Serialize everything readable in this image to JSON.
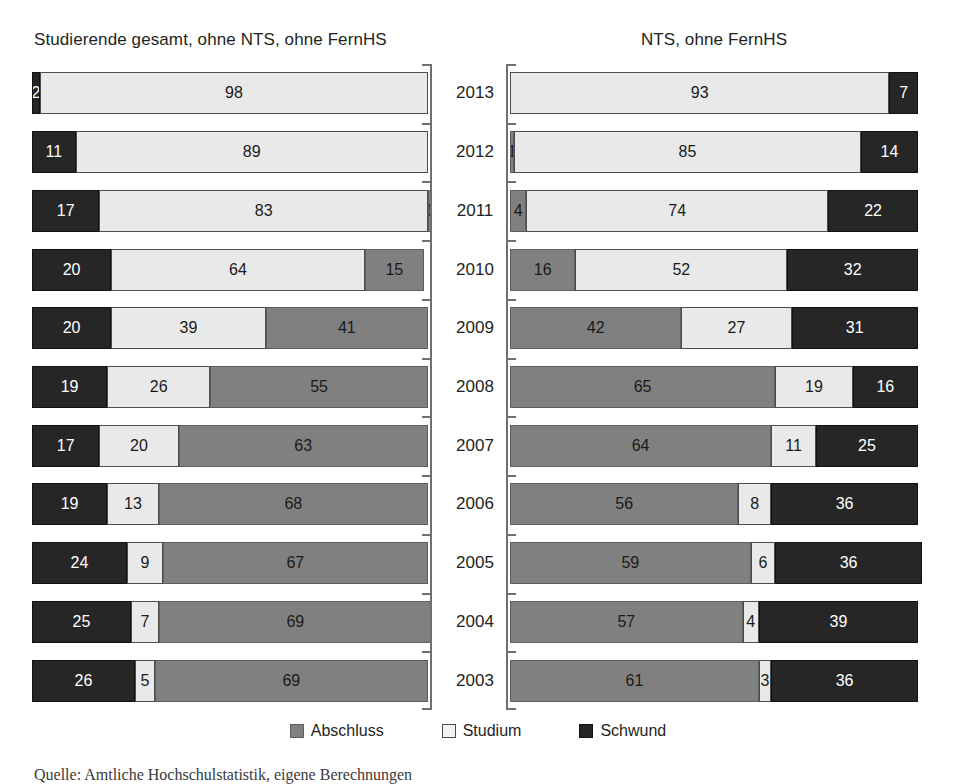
{
  "chart_data": {
    "type": "bar",
    "subtype": "stacked-horizontal-100pct",
    "title": "",
    "xlabel": "",
    "ylabel": "",
    "xlim": [
      0,
      100
    ],
    "grid": false,
    "legend_position": "bottom-center",
    "legend": [
      "Abschluss",
      "Studium",
      "Schwund"
    ],
    "categories": [
      "2013",
      "2012",
      "2011",
      "2010",
      "2009",
      "2008",
      "2007",
      "2006",
      "2005",
      "2004",
      "2003"
    ],
    "panels": [
      {
        "title": "Studierende gesamt, ohne NTS, ohne FernHS",
        "segment_order": [
          "Schwund",
          "Studium",
          "Abschluss"
        ],
        "series": [
          {
            "name": "Schwund",
            "values": [
              2,
              11,
              17,
              20,
              20,
              19,
              17,
              19,
              24,
              25,
              26
            ]
          },
          {
            "name": "Studium",
            "values": [
              98,
              89,
              83,
              64,
              39,
              26,
              20,
              13,
              9,
              7,
              5
            ]
          },
          {
            "name": "Abschluss",
            "values": [
              0,
              0,
              1,
              15,
              41,
              55,
              63,
              68,
              67,
              69,
              69
            ]
          }
        ]
      },
      {
        "title": "NTS, ohne FernHS",
        "segment_order": [
          "Abschluss",
          "Studium",
          "Schwund"
        ],
        "series": [
          {
            "name": "Abschluss",
            "values": [
              0,
              1,
              4,
              16,
              42,
              65,
              64,
              56,
              59,
              57,
              61
            ]
          },
          {
            "name": "Studium",
            "values": [
              93,
              85,
              74,
              52,
              27,
              19,
              11,
              8,
              6,
              4,
              3
            ]
          },
          {
            "name": "Schwund",
            "values": [
              7,
              14,
              22,
              32,
              31,
              16,
              25,
              36,
              36,
              39,
              36
            ]
          }
        ]
      }
    ],
    "colors": {
      "abschluss": "#808080",
      "studium": "#e9e9e9",
      "schwund": "#262626",
      "axis": "#6f6f6f",
      "text": "#231f20",
      "background": "#ffffff"
    }
  },
  "source_note": "Quelle: Amtliche Hochschulstatistik, eigene Berechnungen"
}
